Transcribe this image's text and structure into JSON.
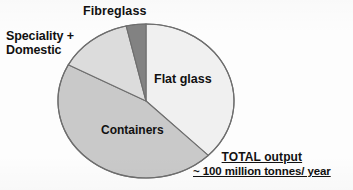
{
  "chart_data": {
    "type": "pie",
    "title": "",
    "subtitle": "",
    "xlabel": "",
    "ylabel": "",
    "legend_position": "none",
    "grid": false,
    "units": "million tonnes/ year",
    "total_label": "TOTAL output",
    "total_value": "~ 100 million tonnes/ year",
    "categories": [
      "Flat glass",
      "Containers",
      "Speciality + Domestic",
      "Fibreglass"
    ],
    "values": [
      37.5,
      45.3,
      13.6,
      3.6
    ],
    "value_unit": "percent",
    "slices": [
      {
        "label": "Flat glass",
        "value": 37.5,
        "start_angle": 0,
        "end_angle": 135,
        "color": "#f0f0f0"
      },
      {
        "label": "Containers",
        "value": 45.3,
        "start_angle": 135,
        "end_angle": 298,
        "color": "#c9c9c9"
      },
      {
        "label": "Speciality + Domestic",
        "value": 13.6,
        "start_angle": 298,
        "end_angle": 347,
        "color": "#dcdcdc"
      },
      {
        "label": "Fibreglass",
        "value": 3.6,
        "start_angle": 347,
        "end_angle": 360,
        "color": "#828282"
      }
    ]
  },
  "labels": {
    "fibreglass": "Fibreglass",
    "speciality_line1": "Speciality +",
    "speciality_line2": "Domestic",
    "flat_glass": "Flat glass",
    "containers": "Containers"
  },
  "total": {
    "title": "TOTAL output",
    "value": "~ 100 million tonnes/ year"
  },
  "colors": {
    "flat_glass": "#f0f0f0",
    "containers": "#c9c9c9",
    "speciality": "#dcdcdc",
    "fibreglass": "#828282",
    "outline": "#6e6e6e",
    "text": "#111111",
    "background": "#fdfdfd"
  }
}
